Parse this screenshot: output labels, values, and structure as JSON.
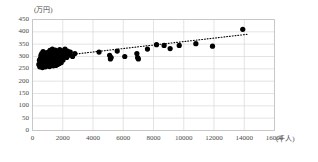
{
  "chart_data": {
    "type": "scatter",
    "title": "",
    "subtitle": "",
    "xlabel": "(千人)",
    "ylabel": "(万円)",
    "xlim": [
      0,
      16000
    ],
    "ylim": [
      0,
      450
    ],
    "xticks": [
      0,
      2000,
      4000,
      6000,
      8000,
      10000,
      12000,
      14000,
      16000
    ],
    "yticks": [
      0,
      50,
      100,
      150,
      200,
      250,
      300,
      350,
      400,
      450
    ],
    "xtick_labels": [
      "0",
      "2000",
      "4000",
      "6000",
      "8000",
      "10000",
      "12000",
      "14000",
      "16000"
    ],
    "ytick_labels": [
      "0",
      "50",
      "100",
      "150",
      "200",
      "250",
      "300",
      "350",
      "400",
      "450"
    ],
    "grid": true,
    "grid_color": "#d9d9d9",
    "axis_color": "#bfbfbf",
    "marker_color": "#000000",
    "marker_size": 4,
    "legend": null,
    "legend_position": "none",
    "trendline": {
      "style": "dotted",
      "color": "#000000",
      "x0": 700,
      "y0": 295,
      "x1": 14200,
      "y1": 390
    },
    "points": [
      {
        "x": 420,
        "y": 268
      },
      {
        "x": 460,
        "y": 285
      },
      {
        "x": 480,
        "y": 258
      },
      {
        "x": 520,
        "y": 292
      },
      {
        "x": 540,
        "y": 272
      },
      {
        "x": 560,
        "y": 305
      },
      {
        "x": 580,
        "y": 263
      },
      {
        "x": 600,
        "y": 288
      },
      {
        "x": 610,
        "y": 312
      },
      {
        "x": 630,
        "y": 276
      },
      {
        "x": 650,
        "y": 298
      },
      {
        "x": 660,
        "y": 255
      },
      {
        "x": 680,
        "y": 283
      },
      {
        "x": 700,
        "y": 320
      },
      {
        "x": 710,
        "y": 267
      },
      {
        "x": 730,
        "y": 295
      },
      {
        "x": 740,
        "y": 278
      },
      {
        "x": 760,
        "y": 308
      },
      {
        "x": 780,
        "y": 262
      },
      {
        "x": 790,
        "y": 290
      },
      {
        "x": 810,
        "y": 273
      },
      {
        "x": 830,
        "y": 302
      },
      {
        "x": 840,
        "y": 285
      },
      {
        "x": 860,
        "y": 258
      },
      {
        "x": 880,
        "y": 315
      },
      {
        "x": 890,
        "y": 280
      },
      {
        "x": 910,
        "y": 296
      },
      {
        "x": 930,
        "y": 266
      },
      {
        "x": 940,
        "y": 288
      },
      {
        "x": 960,
        "y": 310
      },
      {
        "x": 980,
        "y": 274
      },
      {
        "x": 1000,
        "y": 300
      },
      {
        "x": 1010,
        "y": 282
      },
      {
        "x": 1030,
        "y": 263
      },
      {
        "x": 1050,
        "y": 318
      },
      {
        "x": 1060,
        "y": 292
      },
      {
        "x": 1080,
        "y": 270
      },
      {
        "x": 1100,
        "y": 305
      },
      {
        "x": 1110,
        "y": 286
      },
      {
        "x": 1130,
        "y": 259
      },
      {
        "x": 1150,
        "y": 298
      },
      {
        "x": 1160,
        "y": 325
      },
      {
        "x": 1180,
        "y": 277
      },
      {
        "x": 1200,
        "y": 294
      },
      {
        "x": 1210,
        "y": 268
      },
      {
        "x": 1230,
        "y": 312
      },
      {
        "x": 1250,
        "y": 284
      },
      {
        "x": 1260,
        "y": 301
      },
      {
        "x": 1280,
        "y": 265
      },
      {
        "x": 1300,
        "y": 290
      },
      {
        "x": 1310,
        "y": 330
      },
      {
        "x": 1330,
        "y": 276
      },
      {
        "x": 1350,
        "y": 308
      },
      {
        "x": 1360,
        "y": 287
      },
      {
        "x": 1380,
        "y": 262
      },
      {
        "x": 1400,
        "y": 296
      },
      {
        "x": 1420,
        "y": 318
      },
      {
        "x": 1430,
        "y": 281
      },
      {
        "x": 1450,
        "y": 303
      },
      {
        "x": 1470,
        "y": 271
      },
      {
        "x": 1490,
        "y": 292
      },
      {
        "x": 1500,
        "y": 326
      },
      {
        "x": 1520,
        "y": 285
      },
      {
        "x": 1540,
        "y": 264
      },
      {
        "x": 1560,
        "y": 310
      },
      {
        "x": 1580,
        "y": 297
      },
      {
        "x": 1600,
        "y": 278
      },
      {
        "x": 1620,
        "y": 322
      },
      {
        "x": 1640,
        "y": 289
      },
      {
        "x": 1660,
        "y": 268
      },
      {
        "x": 1680,
        "y": 305
      },
      {
        "x": 1700,
        "y": 293
      },
      {
        "x": 1720,
        "y": 315
      },
      {
        "x": 1740,
        "y": 280
      },
      {
        "x": 1760,
        "y": 300
      },
      {
        "x": 1780,
        "y": 272
      },
      {
        "x": 1800,
        "y": 328
      },
      {
        "x": 1820,
        "y": 296
      },
      {
        "x": 1850,
        "y": 285
      },
      {
        "x": 1880,
        "y": 309
      },
      {
        "x": 1900,
        "y": 276
      },
      {
        "x": 1930,
        "y": 318
      },
      {
        "x": 1960,
        "y": 294
      },
      {
        "x": 1990,
        "y": 305
      },
      {
        "x": 2020,
        "y": 286
      },
      {
        "x": 2060,
        "y": 324
      },
      {
        "x": 2100,
        "y": 300
      },
      {
        "x": 2150,
        "y": 330
      },
      {
        "x": 2200,
        "y": 312
      },
      {
        "x": 2260,
        "y": 296
      },
      {
        "x": 2320,
        "y": 322
      },
      {
        "x": 2400,
        "y": 305
      },
      {
        "x": 2500,
        "y": 318
      },
      {
        "x": 2650,
        "y": 300
      },
      {
        "x": 2800,
        "y": 312
      },
      {
        "x": 4400,
        "y": 318
      },
      {
        "x": 5100,
        "y": 305
      },
      {
        "x": 5150,
        "y": 290
      },
      {
        "x": 5200,
        "y": 296
      },
      {
        "x": 5600,
        "y": 322
      },
      {
        "x": 6100,
        "y": 300
      },
      {
        "x": 6900,
        "y": 312
      },
      {
        "x": 6950,
        "y": 296
      },
      {
        "x": 7000,
        "y": 290
      },
      {
        "x": 7600,
        "y": 330
      },
      {
        "x": 8200,
        "y": 348
      },
      {
        "x": 8700,
        "y": 345
      },
      {
        "x": 9100,
        "y": 332
      },
      {
        "x": 9700,
        "y": 345
      },
      {
        "x": 10800,
        "y": 352
      },
      {
        "x": 11900,
        "y": 342
      },
      {
        "x": 13900,
        "y": 410
      }
    ]
  }
}
